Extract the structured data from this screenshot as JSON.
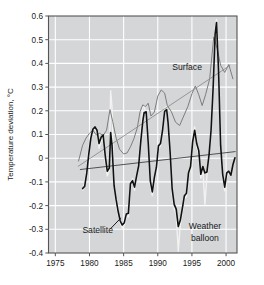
{
  "chart_data": {
    "type": "line",
    "title": "",
    "xlabel": "",
    "ylabel": "Temperature deviation, °C",
    "xlim": [
      1974.0,
      2001.6
    ],
    "ylim": [
      -0.4,
      0.6
    ],
    "grid": true,
    "legend_position": "inline-annotations",
    "xticks": [
      1975,
      1980,
      1985,
      1990,
      1995,
      2000
    ],
    "xtick_labels": [
      "1975",
      "1980",
      "1985",
      "1990",
      "1995",
      "2000"
    ],
    "yticks": [
      -0.4,
      -0.3,
      -0.2,
      -0.1,
      0,
      0.1,
      0.2,
      0.3,
      0.4,
      0.5,
      0.6
    ],
    "ytick_labels": [
      "-0.4",
      "-0.3",
      "-0.2",
      "-0.1",
      "0",
      "0.1",
      "0.2",
      "0.3",
      "0.4",
      "0.5",
      "0.6"
    ],
    "annotations": [
      {
        "name": "surface-label",
        "text": "Surface",
        "x": 1994.3,
        "y": 0.385
      },
      {
        "name": "satellite-label",
        "text": "Satellite",
        "x": 1981.2,
        "y": -0.305
      },
      {
        "name": "weather-balloon-label-line1",
        "text": "Weather",
        "x": 1996.9,
        "y": -0.285
      },
      {
        "name": "weather-balloon-label-line2",
        "text": "balloon",
        "x": 1996.9,
        "y": -0.335
      }
    ],
    "series": [
      {
        "name": "Surface",
        "color": "#7d7d7d",
        "linewidth": 1.0,
        "x": [
          1978.4,
          1979.0,
          1979.5,
          1980.0,
          1980.5,
          1981.0,
          1981.5,
          1982.0,
          1982.5,
          1983.0,
          1983.4,
          1983.9,
          1984.4,
          1985.0,
          1985.5,
          1986.0,
          1986.5,
          1987.0,
          1987.4,
          1987.8,
          1988.2,
          1988.6,
          1989.0,
          1989.5,
          1990.0,
          1990.5,
          1991.0,
          1991.4,
          1992.0,
          1992.6,
          1993.2,
          1993.8,
          1994.4,
          1995.0,
          1995.5,
          1996.0,
          1996.5,
          1997.0,
          1997.6,
          1998.2,
          1998.7,
          1999.2,
          1999.8,
          2000.4,
          2001.0
        ],
        "y": [
          -0.012,
          0.055,
          0.085,
          0.105,
          0.118,
          0.098,
          0.105,
          0.095,
          0.118,
          0.205,
          0.155,
          0.085,
          0.038,
          0.018,
          0.022,
          0.048,
          0.082,
          0.128,
          0.196,
          0.225,
          0.218,
          0.232,
          0.178,
          0.195,
          0.262,
          0.288,
          0.275,
          0.222,
          0.196,
          0.152,
          0.138,
          0.178,
          0.218,
          0.272,
          0.305,
          0.268,
          0.222,
          0.268,
          0.335,
          0.512,
          0.462,
          0.392,
          0.362,
          0.395,
          0.335
        ]
      },
      {
        "name": "Satellite",
        "color": "#111111",
        "linewidth": 1.6,
        "x": [
          1979.0,
          1979.3,
          1979.6,
          1979.9,
          1980.2,
          1980.5,
          1980.8,
          1981.1,
          1981.4,
          1981.7,
          1982.0,
          1982.3,
          1982.6,
          1982.9,
          1983.1,
          1983.3,
          1983.6,
          1983.9,
          1984.2,
          1984.5,
          1984.8,
          1985.1,
          1985.4,
          1985.7,
          1986.0,
          1986.3,
          1986.6,
          1986.9,
          1987.2,
          1987.5,
          1987.8,
          1988.0,
          1988.3,
          1988.6,
          1988.9,
          1989.2,
          1989.5,
          1989.8,
          1990.1,
          1990.4,
          1990.7,
          1991.0,
          1991.3,
          1991.5,
          1991.8,
          1992.1,
          1992.4,
          1992.7,
          1993.0,
          1993.3,
          1993.6,
          1993.9,
          1994.2,
          1994.5,
          1994.8,
          1995.1,
          1995.4,
          1995.7,
          1996.0,
          1996.3,
          1996.6,
          1996.9,
          1997.2,
          1997.5,
          1997.8,
          1998.1,
          1998.4,
          1998.6,
          1998.9,
          1999.2,
          1999.5,
          1999.8,
          2000.1,
          2000.4,
          2000.7,
          2001.0,
          2001.3
        ],
        "y": [
          -0.128,
          -0.118,
          -0.062,
          0.018,
          0.085,
          0.122,
          0.132,
          0.118,
          0.062,
          0.088,
          0.098,
          0.012,
          -0.055,
          -0.042,
          0.108,
          0.055,
          -0.115,
          -0.175,
          -0.225,
          -0.265,
          -0.282,
          -0.272,
          -0.235,
          -0.232,
          -0.108,
          -0.095,
          -0.122,
          -0.075,
          -0.032,
          0.068,
          0.155,
          0.192,
          0.196,
          0.065,
          -0.095,
          -0.142,
          -0.082,
          -0.038,
          0.052,
          0.062,
          0.118,
          0.198,
          0.205,
          0.152,
          0.028,
          -0.128,
          -0.195,
          -0.215,
          -0.288,
          -0.262,
          -0.212,
          -0.158,
          -0.148,
          -0.062,
          -0.035,
          0.068,
          0.118,
          0.062,
          0.032,
          -0.068,
          -0.035,
          -0.062,
          -0.058,
          0.012,
          0.118,
          0.295,
          0.525,
          0.572,
          0.368,
          0.055,
          -0.068,
          -0.122,
          -0.062,
          -0.055,
          -0.072,
          -0.028,
          0.002
        ]
      },
      {
        "name": "Weather balloon",
        "color": "#f2f2f2",
        "linewidth": 1.4,
        "x": [
          1979.0,
          1979.3,
          1979.6,
          1979.9,
          1980.2,
          1980.5,
          1980.8,
          1981.1,
          1981.4,
          1981.7,
          1982.0,
          1982.3,
          1982.6,
          1982.9,
          1983.1,
          1983.3,
          1983.6,
          1983.9,
          1984.2,
          1984.5,
          1984.8,
          1985.1,
          1985.4,
          1985.7,
          1986.0,
          1986.3,
          1986.6,
          1986.9,
          1987.2,
          1987.5,
          1987.8,
          1988.0,
          1988.3,
          1988.6,
          1988.9,
          1989.2,
          1989.5,
          1989.8,
          1990.1,
          1990.4,
          1990.7,
          1991.0,
          1991.3,
          1991.5,
          1991.8,
          1992.1,
          1992.4,
          1992.7,
          1993.0,
          1993.3,
          1993.6,
          1993.9,
          1994.2,
          1994.5,
          1994.8,
          1995.1,
          1995.4,
          1995.7,
          1996.0,
          1996.3,
          1996.6,
          1996.9,
          1997.2,
          1997.5,
          1997.8,
          1998.1,
          1998.4,
          1998.6,
          1998.9,
          1999.2,
          1999.5,
          1999.8,
          2000.1,
          2000.4
        ],
        "y": [
          -0.135,
          -0.102,
          -0.048,
          0.038,
          0.098,
          0.118,
          0.125,
          0.108,
          0.042,
          0.072,
          0.082,
          -0.015,
          -0.075,
          -0.052,
          0.285,
          0.215,
          -0.105,
          -0.195,
          -0.238,
          -0.272,
          -0.295,
          -0.282,
          -0.245,
          -0.248,
          -0.122,
          -0.085,
          -0.135,
          -0.068,
          -0.022,
          0.098,
          0.215,
          0.222,
          0.182,
          0.048,
          -0.112,
          -0.158,
          -0.095,
          -0.048,
          0.042,
          0.052,
          0.132,
          0.212,
          0.218,
          0.138,
          0.012,
          -0.145,
          -0.215,
          -0.235,
          -0.392,
          -0.282,
          -0.225,
          -0.172,
          -0.162,
          -0.075,
          -0.048,
          0.078,
          0.132,
          0.048,
          0.018,
          -0.085,
          -0.048,
          -0.195,
          -0.072,
          0.002,
          0.132,
          0.315,
          0.545,
          0.585,
          0.385,
          0.042,
          -0.085,
          -0.138,
          -0.075,
          -0.068
        ]
      }
    ],
    "trendlines": [
      {
        "name": "Surface trend",
        "color": "#8a8a8a",
        "x": [
          1978.3,
          2000.6
        ],
        "y": [
          -0.035,
          0.392
        ]
      },
      {
        "name": "Satellite trend",
        "color": "#3a3a3a",
        "x": [
          1978.6,
          2001.4
        ],
        "y": [
          -0.048,
          0.028
        ]
      }
    ],
    "plot_background": "#d4d6d8",
    "grid_color": "#ffffff",
    "frame_color": "#555555"
  }
}
